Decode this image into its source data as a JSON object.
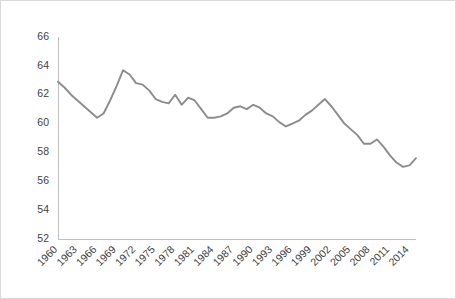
{
  "chart_data": {
    "type": "line",
    "title": "",
    "subtitle": "",
    "xlabel": "",
    "ylabel": "",
    "grid": false,
    "legend": false,
    "legend_position": "none",
    "line_color": "#8c8c8c",
    "axis_color": "#bfbfbf",
    "border_color": "#d9d9d9",
    "background_color": "#ffffff",
    "xlim": [
      1960,
      2015
    ],
    "ylim": [
      52,
      66
    ],
    "ytick_step": 2,
    "ytick_labels": [
      "66",
      "64",
      "62",
      "60",
      "58",
      "56",
      "54",
      "52"
    ],
    "ytick_values": [
      66,
      64,
      62,
      60,
      58,
      56,
      54,
      52
    ],
    "xtick_labels": [
      "1960",
      "1963",
      "1966",
      "1969",
      "1972",
      "1975",
      "1978",
      "1981",
      "1984",
      "1987",
      "1990",
      "1993",
      "1996",
      "1999",
      "2002",
      "2005",
      "2008",
      "2011",
      "2014"
    ],
    "xtick_values": [
      1960,
      1963,
      1966,
      1969,
      1972,
      1975,
      1978,
      1981,
      1984,
      1987,
      1990,
      1993,
      1996,
      1999,
      2002,
      2005,
      2008,
      2011,
      2014
    ],
    "xtick_rotation": -45,
    "series": [
      {
        "name": "value",
        "x": [
          1960,
          1961,
          1962,
          1963,
          1964,
          1965,
          1966,
          1967,
          1968,
          1969,
          1970,
          1971,
          1972,
          1973,
          1974,
          1975,
          1976,
          1977,
          1978,
          1979,
          1980,
          1981,
          1982,
          1983,
          1984,
          1985,
          1986,
          1987,
          1988,
          1989,
          1990,
          1991,
          1992,
          1993,
          1994,
          1995,
          1996,
          1997,
          1998,
          1999,
          2000,
          2001,
          2002,
          2003,
          2004,
          2005,
          2006,
          2007,
          2008,
          2009,
          2010,
          2011,
          2012,
          2013,
          2014,
          2015
        ],
        "values": [
          62.9,
          62.5,
          62.0,
          61.6,
          61.2,
          60.8,
          60.4,
          60.7,
          61.6,
          62.6,
          63.7,
          63.4,
          62.8,
          62.7,
          62.3,
          61.7,
          61.5,
          61.4,
          62.0,
          61.3,
          61.8,
          61.6,
          61.0,
          60.4,
          60.4,
          60.5,
          60.7,
          61.1,
          61.2,
          61.0,
          61.3,
          61.1,
          60.7,
          60.5,
          60.1,
          59.8,
          60.0,
          60.2,
          60.6,
          60.9,
          61.3,
          61.7,
          61.2,
          60.6,
          60.0,
          59.6,
          59.2,
          58.6,
          58.6,
          58.9,
          58.4,
          57.8,
          57.3,
          57.0,
          57.1,
          57.6
        ]
      }
    ]
  },
  "axes": {
    "plot_left": 57,
    "plot_right": 415,
    "plot_top": 36,
    "plot_bottom": 238
  }
}
